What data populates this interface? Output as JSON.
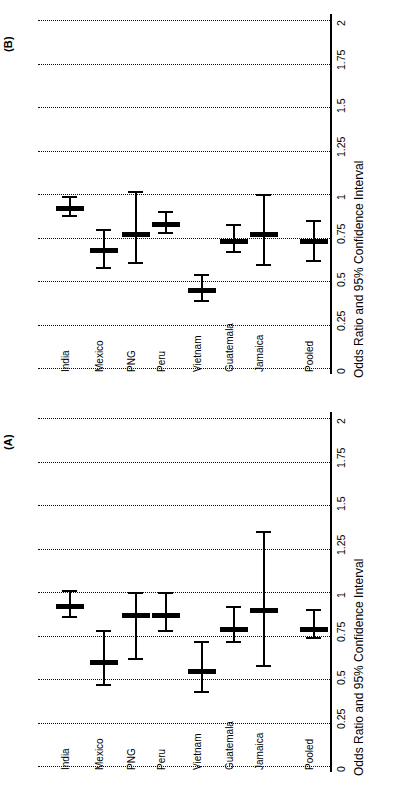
{
  "figure": {
    "panels": [
      {
        "letter": "(B)",
        "axis_title": "Odds Ratio and 95% Confidence Interval",
        "tick_labels": [
          "0",
          "0.25",
          "0.5",
          "0.75",
          "1",
          "1.25",
          "1.5",
          "1.75",
          "2"
        ]
      },
      {
        "letter": "(A)",
        "axis_title": "Odds Ratio and 95% Confidence Interval",
        "tick_labels": [
          "0",
          "0.25",
          "0.5",
          "0.75",
          "1",
          "1.25",
          "1.5",
          "1.75",
          "2"
        ]
      }
    ]
  },
  "chart_data": [
    {
      "type": "scatter",
      "subtype": "forest-plot",
      "title": "(B)",
      "xlabel": "",
      "ylabel": "Odds Ratio and 95% Confidence Interval",
      "orientation": "rotated-90-ccw",
      "ylim": [
        0,
        2
      ],
      "yticks": [
        0,
        0.25,
        0.5,
        0.75,
        1,
        1.25,
        1.5,
        1.75,
        2
      ],
      "grid": true,
      "legend": "none",
      "categories": [
        "India",
        "Mexico",
        "PNG",
        "Peru",
        "Vietnam",
        "Guatemala",
        "Jamaica",
        "Pooled"
      ],
      "estimates": [
        0.93,
        0.69,
        0.78,
        0.84,
        0.46,
        0.74,
        0.78,
        0.74
      ],
      "ci_lower": [
        0.88,
        0.58,
        0.61,
        0.78,
        0.39,
        0.67,
        0.6,
        0.62
      ],
      "ci_upper": [
        0.99,
        0.8,
        1.02,
        0.9,
        0.54,
        0.83,
        1.0,
        0.85
      ]
    },
    {
      "type": "scatter",
      "subtype": "forest-plot",
      "title": "(A)",
      "xlabel": "",
      "ylabel": "Odds Ratio and 95% Confidence Interval",
      "orientation": "rotated-90-ccw",
      "ylim": [
        0,
        2
      ],
      "yticks": [
        0,
        0.25,
        0.5,
        0.75,
        1,
        1.25,
        1.5,
        1.75,
        2
      ],
      "grid": true,
      "legend": "none",
      "categories": [
        "India",
        "Mexico",
        "PNG",
        "Peru",
        "Vietnam",
        "Guatemala",
        "Jamaica",
        "Pooled"
      ],
      "estimates": [
        0.93,
        0.61,
        0.88,
        0.88,
        0.56,
        0.8,
        0.91,
        0.8
      ],
      "ci_lower": [
        0.86,
        0.47,
        0.62,
        0.78,
        0.43,
        0.72,
        0.58,
        0.74
      ],
      "ci_upper": [
        1.01,
        0.78,
        1.0,
        1.0,
        0.72,
        0.92,
        1.35,
        0.9
      ]
    }
  ]
}
